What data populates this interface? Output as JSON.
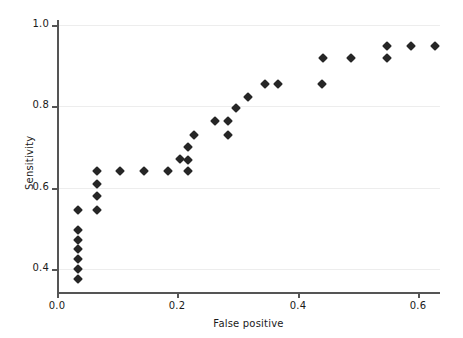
{
  "chart_data": {
    "type": "scatter",
    "title": "",
    "xlabel": "False positive",
    "ylabel": "Sensitivity",
    "xlim": [
      -0.02,
      0.66
    ],
    "ylim": [
      0.355,
      1.02
    ],
    "xticks": [
      0.0,
      0.2,
      0.4,
      0.6
    ],
    "xtick_labels": [
      "0.0",
      "0.2",
      "0.4",
      "0.6"
    ],
    "yticks": [
      0.4,
      0.6,
      0.8,
      1.0
    ],
    "ytick_labels": [
      "0.4",
      "0.6",
      "0.8",
      "1.0"
    ],
    "grid": "horizontal",
    "legend": "none",
    "marker": "diamond",
    "marker_color": "#262626",
    "points": [
      {
        "x": 0.035,
        "y": 0.375
      },
      {
        "x": 0.035,
        "y": 0.4
      },
      {
        "x": 0.035,
        "y": 0.424
      },
      {
        "x": 0.035,
        "y": 0.448
      },
      {
        "x": 0.035,
        "y": 0.472
      },
      {
        "x": 0.035,
        "y": 0.497
      },
      {
        "x": 0.035,
        "y": 0.545
      },
      {
        "x": 0.067,
        "y": 0.545
      },
      {
        "x": 0.067,
        "y": 0.58
      },
      {
        "x": 0.067,
        "y": 0.61
      },
      {
        "x": 0.067,
        "y": 0.64
      },
      {
        "x": 0.105,
        "y": 0.64
      },
      {
        "x": 0.145,
        "y": 0.64
      },
      {
        "x": 0.185,
        "y": 0.64
      },
      {
        "x": 0.205,
        "y": 0.67
      },
      {
        "x": 0.218,
        "y": 0.64
      },
      {
        "x": 0.218,
        "y": 0.668
      },
      {
        "x": 0.218,
        "y": 0.7
      },
      {
        "x": 0.228,
        "y": 0.73
      },
      {
        "x": 0.262,
        "y": 0.763
      },
      {
        "x": 0.285,
        "y": 0.73
      },
      {
        "x": 0.285,
        "y": 0.763
      },
      {
        "x": 0.298,
        "y": 0.795
      },
      {
        "x": 0.318,
        "y": 0.822
      },
      {
        "x": 0.345,
        "y": 0.855
      },
      {
        "x": 0.368,
        "y": 0.855
      },
      {
        "x": 0.44,
        "y": 0.855
      },
      {
        "x": 0.442,
        "y": 0.918
      },
      {
        "x": 0.488,
        "y": 0.918
      },
      {
        "x": 0.548,
        "y": 0.918
      },
      {
        "x": 0.548,
        "y": 0.948
      },
      {
        "x": 0.588,
        "y": 0.948
      },
      {
        "x": 0.628,
        "y": 0.948
      }
    ]
  },
  "axes": {
    "x_title": "False positive",
    "y_title": "Sensitivity"
  }
}
